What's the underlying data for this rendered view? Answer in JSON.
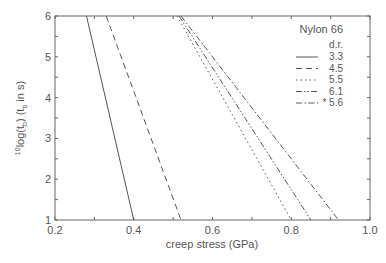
{
  "chart_data": {
    "type": "line",
    "title": "",
    "xlabel": "creep stress (GPa)",
    "ylabel": "10log(t_b)  (t_b in s)",
    "xlim": [
      0.2,
      1.0
    ],
    "ylim": [
      1,
      6
    ],
    "xticks": [
      "0.2",
      "0.4",
      "0.6",
      "0.8",
      "1.0"
    ],
    "yticks": [
      "1",
      "2",
      "3",
      "4",
      "5",
      "6"
    ],
    "grid": false,
    "legend": {
      "title": "Nylon 66",
      "subtitle": "d.r.",
      "position": "upper right",
      "entries": [
        "3.3",
        "4.5",
        "5.5",
        "6.1",
        "* 5.6"
      ]
    },
    "series": [
      {
        "name": "3.3",
        "style": "solid",
        "x": [
          0.28,
          0.4
        ],
        "y": [
          6,
          1
        ]
      },
      {
        "name": "4.5",
        "style": "dashed",
        "x": [
          0.33,
          0.52
        ],
        "y": [
          6,
          1
        ]
      },
      {
        "name": "5.5",
        "style": "dotted",
        "x": [
          0.51,
          0.8
        ],
        "y": [
          6,
          1
        ]
      },
      {
        "name": "6.1",
        "style": "dash-dot-dot",
        "x": [
          0.515,
          0.85
        ],
        "y": [
          6,
          1
        ]
      },
      {
        "name": "* 5.6",
        "style": "dash-dot",
        "x": [
          0.52,
          0.92
        ],
        "y": [
          6,
          1
        ]
      }
    ]
  }
}
